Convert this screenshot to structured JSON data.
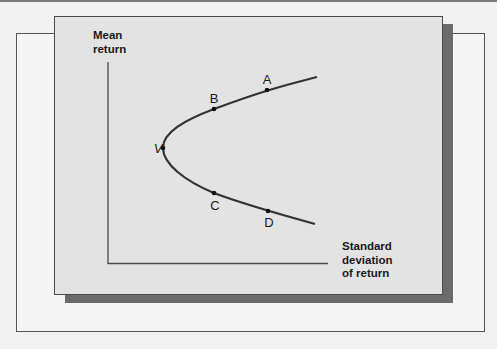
{
  "diagram": {
    "y_axis_label_line1": "Mean",
    "y_axis_label_line2": "return",
    "x_axis_label_line1": "Standard",
    "x_axis_label_line2": "deviation",
    "x_axis_label_line3": "of return",
    "points": [
      {
        "name": "A",
        "label": "A"
      },
      {
        "name": "B",
        "label": "B"
      },
      {
        "name": "V",
        "label": "V"
      },
      {
        "name": "C",
        "label": "C"
      },
      {
        "name": "D",
        "label": "D"
      }
    ],
    "curve": "efficient frontier (hyperbola opening right, vertex V)"
  },
  "colors": {
    "background": "#f1f1f1",
    "panel": "#e3e3e3",
    "shadow": "#6b6b6b",
    "curve": "#333333",
    "text": "#1a1a1a"
  }
}
